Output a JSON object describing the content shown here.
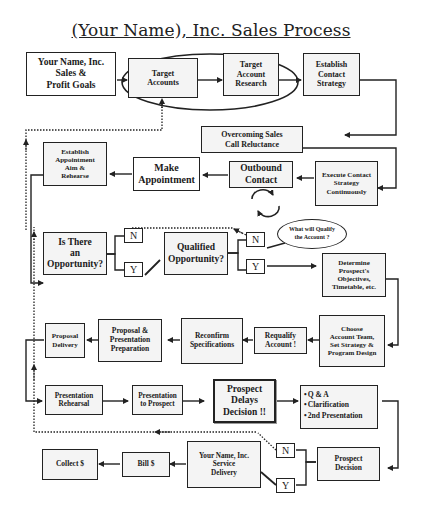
{
  "title": "(Your Name), Inc. Sales Process",
  "colors": {
    "line": "#222222",
    "box_fill": "#f4f4f4",
    "background": "#ffffff"
  },
  "nodes": {
    "sales_goals": "Your Name, Inc.\nSales &\nProfit Goals",
    "target_accounts": "Target\nAccounts",
    "target_research": "Target\nAccount\nResearch",
    "establish_contact": "Establish\nContact\nStrategy",
    "overcoming": "Overcoming Sales\nCall Reluctance",
    "execute_contact": "Execute Contact\nStrategy\nContinuously",
    "outbound": "Outbound\nContact",
    "make_appointment": "Make\nAppointment",
    "establish_appointment": "Establish\nAppointment\nAim &\nRehearse",
    "is_opportunity": "Is There\nan\nOpportunity?",
    "qualified": "Qualified\nOpportunity?",
    "what_qualify": "What will Qualify\nthe Account ?",
    "determine": "Determine\nProspect's\nObjectives,\nTimetable, etc.",
    "choose_team": "Choose\nAccount Team,\nSet Strategy &\nProgram Design",
    "requalify": "Requalify\nAccount !",
    "reconfirm": "Reconfirm\nSpecifications",
    "proposal_prep": "Proposal &\nPresentation\nPreparation",
    "proposal_delivery": "Proposal\nDelivery",
    "pres_rehearsal": "Presentation\nRehearsal",
    "pres_prospect": "Presentation\nto Prospect",
    "delays": "Prospect\nDelays\nDecision !!",
    "prospect_decision": "Prospect\nDecision",
    "service_delivery": "Your Name, Inc.\nService\nDelivery",
    "bill": "Bill $",
    "collect": "Collect $"
  },
  "delay_options": [
    "Q & A",
    "Clarification",
    "2nd Presentation"
  ],
  "decisions": {
    "opp_n": "N",
    "opp_y": "Y",
    "qual_n": "N",
    "qual_y": "Y",
    "dec_n": "N",
    "dec_y": "Y"
  },
  "icons": {
    "cycle": "circular-arrows-icon"
  }
}
